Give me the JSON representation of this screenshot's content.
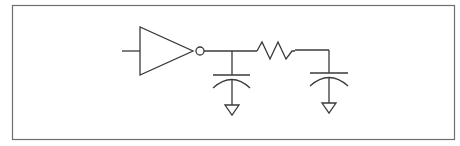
{
  "diagram": {
    "colors": {
      "stroke": "#3a3a3a",
      "frame": "#6e6e6e",
      "background": "#ffffff"
    },
    "components": [
      {
        "id": "inverter",
        "type": "inverter"
      },
      {
        "id": "c1",
        "type": "capacitor"
      },
      {
        "id": "r1",
        "type": "resistor"
      },
      {
        "id": "c2",
        "type": "capacitor"
      },
      {
        "id": "gnd1",
        "type": "ground"
      },
      {
        "id": "gnd2",
        "type": "ground"
      }
    ]
  }
}
